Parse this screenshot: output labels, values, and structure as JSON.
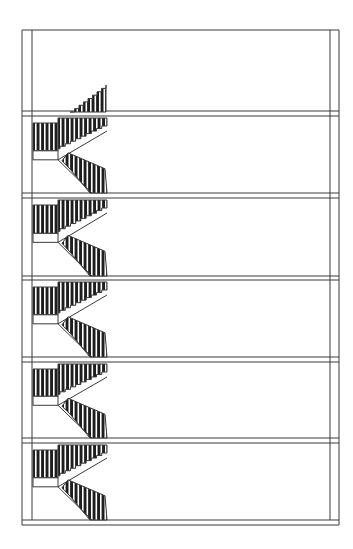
{
  "drawing": {
    "type": "architectural-section",
    "subject": "multi-storey building with switchback (dog-leg) staircase",
    "colors": {
      "background": "#ffffff",
      "line": "#3a3a3a",
      "fill_dark": "#1e1e1e",
      "fill_light": "#ffffff"
    },
    "frame": {
      "outer_left": 22,
      "inner_left": 32,
      "inner_right": 330,
      "outer_right": 339,
      "top": 30,
      "bottom_top": 520,
      "bottom": 525
    },
    "floors": [
      {
        "top": 111,
        "bottom": 116
      },
      {
        "top": 193,
        "bottom": 198
      },
      {
        "top": 276,
        "bottom": 280
      },
      {
        "top": 357,
        "bottom": 362
      },
      {
        "top": 438,
        "bottom": 443
      }
    ],
    "staircase": {
      "x_left": 33,
      "x_right": 107,
      "modules": 5,
      "top_flight_apex": {
        "x": 106,
        "y": 85
      },
      "top_flight_base": {
        "x": 70,
        "y": 112
      }
    }
  }
}
